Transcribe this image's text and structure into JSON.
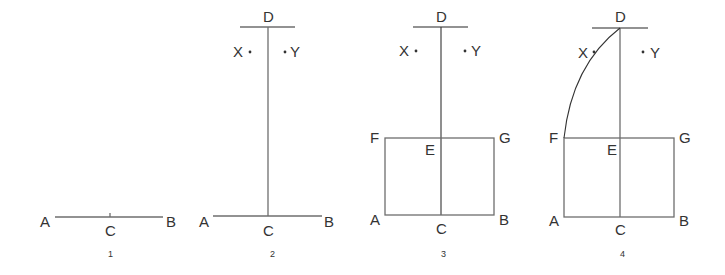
{
  "figure": {
    "panels": [
      {
        "number": "1",
        "labels": {
          "A": "A",
          "B": "B",
          "C": "C"
        }
      },
      {
        "number": "2",
        "labels": {
          "A": "A",
          "B": "B",
          "C": "C",
          "D": "D",
          "X": "X",
          "Y": "Y"
        }
      },
      {
        "number": "3",
        "labels": {
          "A": "A",
          "B": "B",
          "C": "C",
          "D": "D",
          "E": "E",
          "F": "F",
          "G": "G",
          "X": "X",
          "Y": "Y"
        }
      },
      {
        "number": "4",
        "labels": {
          "A": "A",
          "B": "B",
          "C": "C",
          "D": "D",
          "E": "E",
          "F": "F",
          "G": "G",
          "X": "X",
          "Y": "Y"
        }
      }
    ],
    "colors": {
      "line": "#6e6e6e",
      "text": "#333333",
      "background": "#ffffff"
    }
  }
}
